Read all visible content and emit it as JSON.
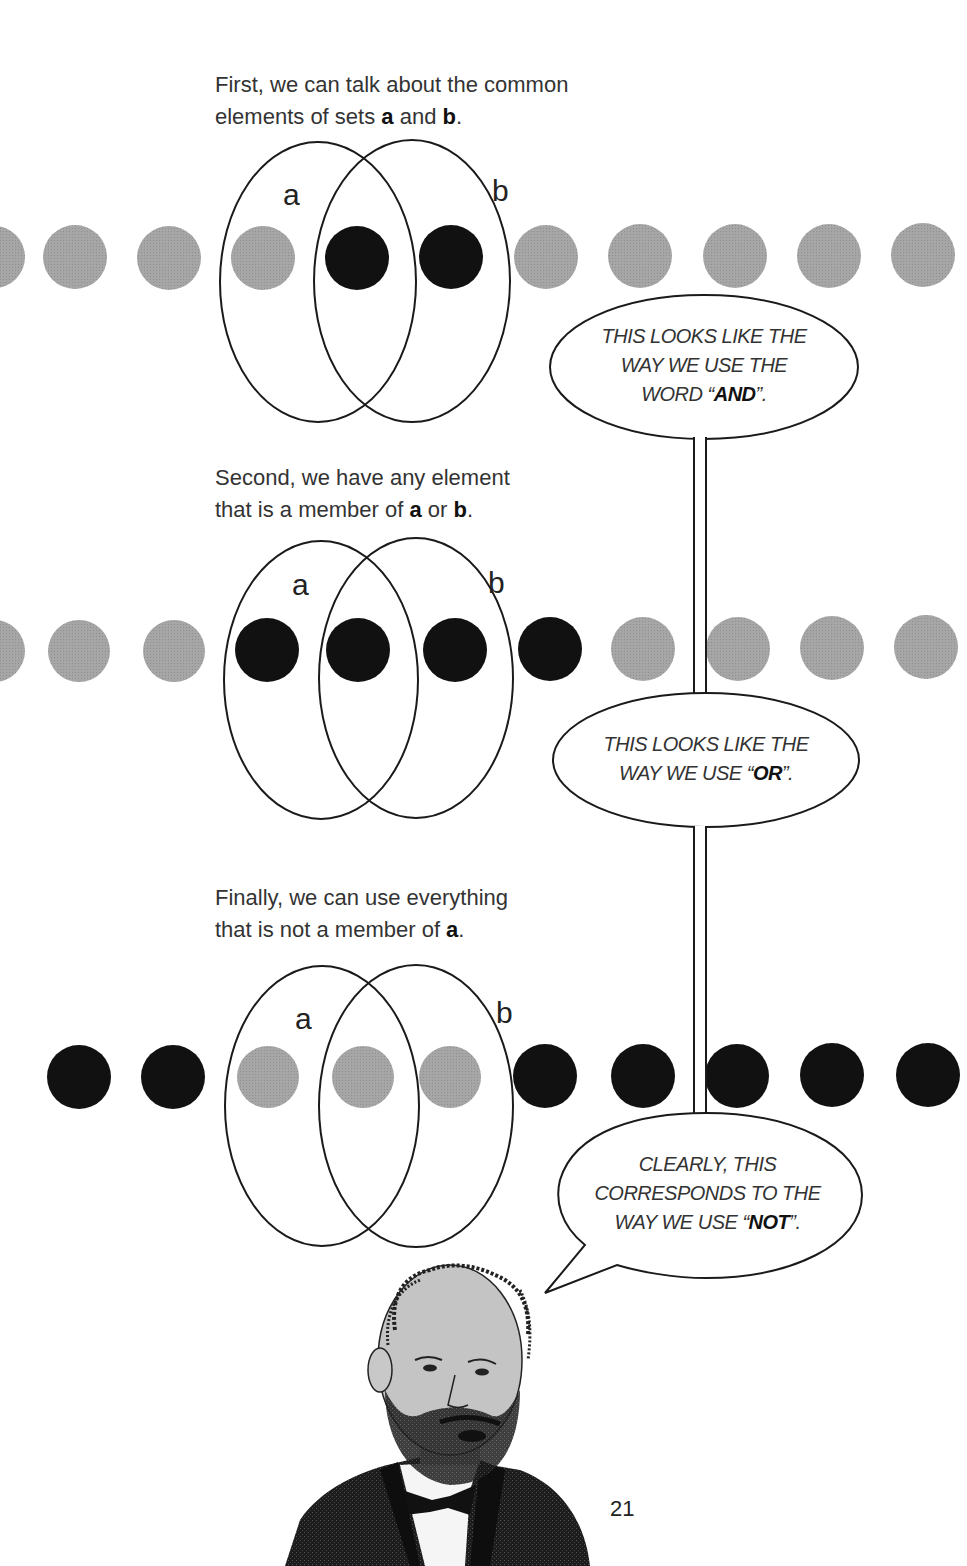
{
  "page": {
    "number": "21"
  },
  "sections": [
    {
      "id": "and",
      "caption": {
        "line1": "First, we can talk about the common",
        "line2_pre": "elements of sets ",
        "var_a": "a",
        "mid": " and ",
        "var_b": "b",
        "end": "."
      },
      "labels": {
        "a": "a",
        "b": "b"
      },
      "bubble": {
        "line1": "THIS LOOKS LIKE THE",
        "line2": "WAY WE USE THE",
        "line3_pre": "WORD “",
        "keyword": "AND",
        "line3_post": "”."
      },
      "dots": [
        "gray",
        "gray",
        "gray",
        "gray",
        "black",
        "black",
        "gray",
        "gray",
        "gray",
        "gray",
        "gray"
      ]
    },
    {
      "id": "or",
      "caption": {
        "line1": "Second, we have any element",
        "line2_pre": "that is a member of ",
        "var_a": "a",
        "mid": " or ",
        "var_b": "b",
        "end": "."
      },
      "labels": {
        "a": "a",
        "b": "b"
      },
      "bubble": {
        "line1": "THIS LOOKS LIKE THE",
        "line2_pre": "WAY WE USE “",
        "keyword": "OR",
        "line2_post": "”."
      },
      "dots": [
        "gray",
        "gray",
        "gray",
        "black",
        "black",
        "black",
        "black",
        "gray",
        "gray",
        "gray",
        "gray"
      ]
    },
    {
      "id": "not",
      "caption": {
        "line1": "Finally, we can use everything",
        "line2_pre": "that is not a member of ",
        "var_a": "a",
        "end": "."
      },
      "labels": {
        "a": "a",
        "b": "b"
      },
      "bubble": {
        "line1": "CLEARLY, THIS",
        "line2": "CORRESPONDS TO THE",
        "line3_pre": "WAY WE USE “",
        "keyword": "NOT",
        "line3_post": "”."
      },
      "dots": [
        "black",
        "black",
        "gray",
        "gray",
        "gray",
        "black",
        "black",
        "black",
        "black",
        "black"
      ]
    }
  ],
  "colors": {
    "gray_dot": "#a3a3a3",
    "black_dot": "#111111",
    "line": "#1a1a1a"
  },
  "illustration": {
    "subject": "portrait of bearded man in bow tie"
  }
}
